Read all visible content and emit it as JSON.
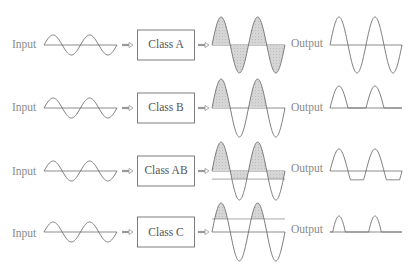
{
  "diagram": {
    "title": "",
    "colors": {
      "line": "#6f6f6f",
      "fill": "#cfcfcf",
      "text": "#8a8a8a",
      "box_text": "#555555"
    },
    "rows": [
      {
        "input_label": "Input",
        "amplifier_label": "Class A",
        "output_label": "Output",
        "conduction": "360° (full cycle)",
        "output_shape": "full-sine"
      },
      {
        "input_label": "Input",
        "amplifier_label": "Class B",
        "output_label": "Output",
        "conduction": "180° (half cycle)",
        "output_shape": "half-wave"
      },
      {
        "input_label": "Input",
        "amplifier_label": "Class AB",
        "output_label": "Output",
        "conduction": "between 180° and 360°",
        "output_shape": "half-wave-plus-flat-negative"
      },
      {
        "input_label": "Input",
        "amplifier_label": "Class C",
        "output_label": "Output",
        "conduction": "less than 180°",
        "output_shape": "narrow-pulses"
      }
    ]
  }
}
